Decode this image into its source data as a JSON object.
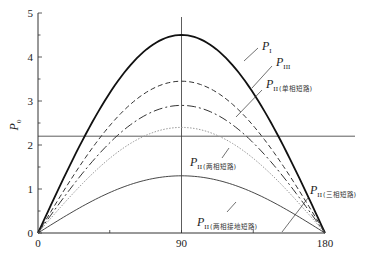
{
  "chart_data": {
    "type": "line",
    "title": "",
    "xlabel": "",
    "ylabel": "P0",
    "xlim": [
      0,
      180
    ],
    "ylim": [
      0,
      5
    ],
    "x_ticks": [
      "0",
      "90",
      "180"
    ],
    "y_ticks": [
      "0",
      "1",
      "2",
      "3",
      "4",
      "5"
    ],
    "grid": false,
    "reference_lines": {
      "vertical_x": 90,
      "horizontal_y": 2.2
    },
    "series": [
      {
        "name": "P_I",
        "label_main": "P",
        "label_sub": "I",
        "label_cn": "",
        "style": "solid-thick",
        "peak": 4.5,
        "x": [
          0,
          30,
          60,
          90,
          120,
          150,
          180
        ],
        "values": [
          0,
          2.25,
          3.9,
          4.5,
          3.9,
          2.25,
          0
        ]
      },
      {
        "name": "P_III",
        "label_main": "P",
        "label_sub": "III",
        "label_cn": "",
        "style": "dashed",
        "peak": 3.45,
        "x": [
          0,
          30,
          60,
          90,
          120,
          150,
          180
        ],
        "values": [
          0,
          1.73,
          2.99,
          3.45,
          2.99,
          1.73,
          0
        ]
      },
      {
        "name": "P_II (单相短路)",
        "label_main": "P",
        "label_sub": "II",
        "label_cn": "(单相短路)",
        "style": "dash-dot",
        "peak": 2.9,
        "x": [
          0,
          30,
          60,
          90,
          120,
          150,
          180
        ],
        "values": [
          0,
          1.45,
          2.51,
          2.9,
          2.51,
          1.45,
          0
        ]
      },
      {
        "name": "P_II (两相短路)",
        "label_main": "P",
        "label_sub": "II",
        "label_cn": "(两相短路)",
        "style": "dotted",
        "peak": 2.4,
        "x": [
          0,
          30,
          60,
          90,
          120,
          150,
          180
        ],
        "values": [
          0,
          1.2,
          2.08,
          2.4,
          2.08,
          1.2,
          0
        ]
      },
      {
        "name": "P_II (两相接地短路)",
        "label_main": "P",
        "label_sub": "II",
        "label_cn": "(两相接地短路)",
        "style": "solid-thin",
        "peak": 1.3,
        "x": [
          0,
          30,
          60,
          90,
          120,
          150,
          180
        ],
        "values": [
          0,
          0.65,
          1.13,
          1.3,
          1.13,
          0.65,
          0
        ]
      },
      {
        "name": "P_II (三相短路)",
        "label_main": "P",
        "label_sub": "II",
        "label_cn": "(三相短路)",
        "style": "on-axis",
        "peak": 0,
        "x": [
          0,
          90,
          180
        ],
        "values": [
          0,
          0,
          0
        ]
      }
    ],
    "legend": "inline leader-line labels on right"
  }
}
